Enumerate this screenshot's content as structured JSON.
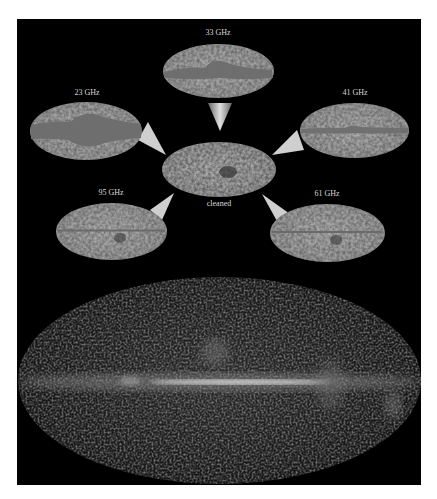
{
  "figure": {
    "maps": [
      {
        "id": "23ghz",
        "label": "23 GHz"
      },
      {
        "id": "33ghz",
        "label": "33 GHz"
      },
      {
        "id": "41ghz",
        "label": "41 GHz"
      },
      {
        "id": "61ghz",
        "label": "61 GHz"
      },
      {
        "id": "95ghz",
        "label": "95 GHz"
      }
    ],
    "center_label": "cleaned",
    "colors": {
      "background": "#000000",
      "map_fill": "#a8a8a8",
      "galactic_band": "#6e6e6e",
      "arrow": "#d0d0d0",
      "label": "#d8d8d8"
    }
  }
}
